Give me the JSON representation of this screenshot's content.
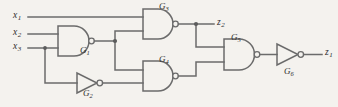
{
  "diagram": {
    "style": "hand-drawn schematic",
    "background_color": "#f4f2ee",
    "line_color": "#6b6b6b",
    "text_color": "#2e2e2e"
  },
  "inputs": [
    {
      "id": "x1",
      "name": "x",
      "sub": "1"
    },
    {
      "id": "x2",
      "name": "x",
      "sub": "2"
    },
    {
      "id": "x3",
      "name": "x",
      "sub": "3"
    }
  ],
  "outputs": [
    {
      "id": "z2",
      "name": "z",
      "sub": "2"
    },
    {
      "id": "z1",
      "name": "z",
      "sub": "1"
    }
  ],
  "gates": [
    {
      "id": "G1",
      "name": "G",
      "sub": "1",
      "type": "nand",
      "inputs": [
        "x2",
        "x3"
      ]
    },
    {
      "id": "G2",
      "name": "G",
      "sub": "2",
      "type": "inverter",
      "inputs": [
        "x3"
      ]
    },
    {
      "id": "G3",
      "name": "G",
      "sub": "3",
      "type": "nand",
      "inputs": [
        "x1",
        "G1"
      ]
    },
    {
      "id": "G4",
      "name": "G",
      "sub": "4",
      "type": "nand",
      "inputs": [
        "G1",
        "G2"
      ]
    },
    {
      "id": "G5",
      "name": "G",
      "sub": "5",
      "type": "nand",
      "inputs": [
        "G3",
        "G4"
      ]
    },
    {
      "id": "G6",
      "name": "G",
      "sub": "6",
      "type": "inverter",
      "inputs": [
        "G5"
      ]
    }
  ]
}
